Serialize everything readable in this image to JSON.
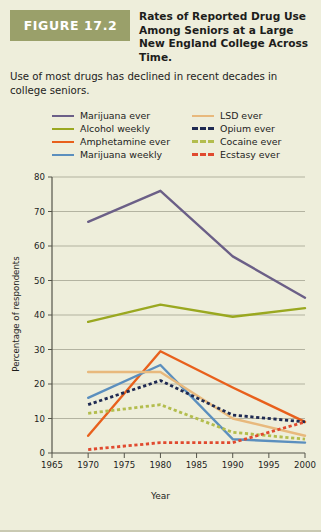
{
  "figure": {
    "badge_label": "FIGURE 17.2",
    "title": "Rates of Reported Drug Use Among Seniors at a Large New England College Across Time.",
    "caption": "Use of most drugs has declined in recent decades in college seniors."
  },
  "legend": {
    "column_left": [
      {
        "label": "Marijuana ever",
        "color": "#6b5f87",
        "style": "solid"
      },
      {
        "label": "Alcohol weekly",
        "color": "#9aa820",
        "style": "solid"
      },
      {
        "label": "Amphetamine ever",
        "color": "#e8601c",
        "style": "solid"
      },
      {
        "label": "Marijuana weekly",
        "color": "#5b8fbe",
        "style": "solid"
      }
    ],
    "column_right": [
      {
        "label": "LSD ever",
        "color": "#e8b97d",
        "style": "solid"
      },
      {
        "label": "Opium ever",
        "color": "#1f2a52",
        "style": "dashed"
      },
      {
        "label": "Cocaine ever",
        "color": "#b3bd4d",
        "style": "dashed"
      },
      {
        "label": "Ecstasy ever",
        "color": "#e04a2f",
        "style": "dashed"
      }
    ]
  },
  "chart_data": {
    "type": "line",
    "title": "Rates of Reported Drug Use Among Seniors at a Large New England College Across Time.",
    "xlabel": "Year",
    "ylabel": "Percentage of respondents",
    "xlim": [
      1965,
      2000
    ],
    "ylim": [
      0,
      80
    ],
    "xticks": [
      1965,
      1970,
      1975,
      1980,
      1985,
      1990,
      1995,
      2000
    ],
    "yticks": [
      0,
      10,
      20,
      30,
      40,
      50,
      60,
      70,
      80
    ],
    "grid": true,
    "legend_position": "above-plot",
    "x": [
      1970,
      1980,
      1990,
      2000
    ],
    "series": [
      {
        "name": "Marijuana ever",
        "color": "#6b5f87",
        "style": "solid",
        "values": [
          67,
          76,
          57,
          45
        ]
      },
      {
        "name": "Alcohol weekly",
        "color": "#9aa820",
        "style": "solid",
        "values": [
          38,
          43,
          39.5,
          42
        ]
      },
      {
        "name": "Amphetamine ever",
        "color": "#e8601c",
        "style": "solid",
        "values": [
          5,
          29.5,
          19,
          9
        ]
      },
      {
        "name": "Marijuana weekly",
        "color": "#5b8fbe",
        "style": "solid",
        "values": [
          16,
          25.5,
          4,
          3
        ]
      },
      {
        "name": "LSD ever",
        "color": "#e8b97d",
        "style": "solid",
        "values": [
          23.5,
          23.5,
          10,
          5
        ]
      },
      {
        "name": "Opium ever",
        "color": "#1f2a52",
        "style": "dashed",
        "values": [
          14,
          21,
          11,
          9
        ]
      },
      {
        "name": "Cocaine ever",
        "color": "#b3bd4d",
        "style": "dashed",
        "values": [
          11.5,
          14,
          6,
          4
        ]
      },
      {
        "name": "Ecstasy ever",
        "color": "#e04a2f",
        "style": "dashed",
        "values": [
          1,
          3,
          3,
          9
        ]
      }
    ]
  }
}
